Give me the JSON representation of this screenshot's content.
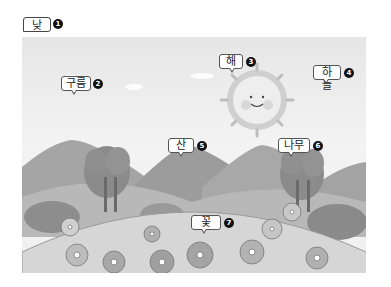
{
  "title": {
    "label": "낮",
    "number": "1"
  },
  "labels": [
    {
      "id": "cloud",
      "text": "구름",
      "number": "2"
    },
    {
      "id": "sun",
      "text": "해",
      "number": "3"
    },
    {
      "id": "sky",
      "text": "하늘",
      "number": "4"
    },
    {
      "id": "mountain",
      "text": "산",
      "number": "5"
    },
    {
      "id": "tree",
      "text": "나무",
      "number": "6"
    },
    {
      "id": "flower",
      "text": "꽃",
      "number": "7"
    }
  ],
  "colors": {
    "sky": "#ececec",
    "mountain": "#9e9e9e",
    "hill": "#d8d8d8",
    "tree": "#8a8a8a",
    "sun": "#e8e8e8"
  }
}
